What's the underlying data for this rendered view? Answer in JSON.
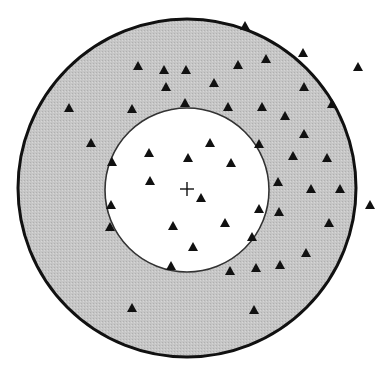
{
  "diagram": {
    "type": "concentric-circles-scatter",
    "colors": {
      "background": "#ffffff",
      "outer_ring_fill": "#c4c4c4",
      "inner_disc_fill": "#ffffff",
      "outer_stroke": "#111111",
      "inner_stroke": "#333333",
      "marker": "#111111"
    },
    "outer_circle": {
      "cx": 187,
      "cy": 188,
      "r": 169
    },
    "inner_circle": {
      "cx": 187,
      "cy": 190,
      "r": 82
    },
    "center_mark": {
      "x": 187,
      "y": 189,
      "size": 7,
      "glyph": "plus"
    },
    "marker_shape": "triangle",
    "markers": [
      [
        245,
        26
      ],
      [
        303,
        53
      ],
      [
        358,
        67
      ],
      [
        138,
        66
      ],
      [
        164,
        70
      ],
      [
        186,
        70
      ],
      [
        238,
        65
      ],
      [
        266,
        59
      ],
      [
        166,
        87
      ],
      [
        214,
        83
      ],
      [
        304,
        87
      ],
      [
        69,
        108
      ],
      [
        132,
        109
      ],
      [
        185,
        103
      ],
      [
        228,
        107
      ],
      [
        262,
        107
      ],
      [
        285,
        116
      ],
      [
        332,
        104
      ],
      [
        91,
        143
      ],
      [
        304,
        134
      ],
      [
        149,
        153
      ],
      [
        188,
        158
      ],
      [
        210,
        143
      ],
      [
        231,
        163
      ],
      [
        259,
        144
      ],
      [
        293,
        156
      ],
      [
        327,
        158
      ],
      [
        112,
        162
      ],
      [
        150,
        181
      ],
      [
        201,
        198
      ],
      [
        278,
        182
      ],
      [
        311,
        189
      ],
      [
        340,
        189
      ],
      [
        370,
        205
      ],
      [
        111,
        205
      ],
      [
        110,
        227
      ],
      [
        173,
        226
      ],
      [
        225,
        223
      ],
      [
        259,
        209
      ],
      [
        279,
        212
      ],
      [
        329,
        223
      ],
      [
        193,
        247
      ],
      [
        252,
        237
      ],
      [
        306,
        253
      ],
      [
        171,
        266
      ],
      [
        230,
        271
      ],
      [
        256,
        268
      ],
      [
        280,
        265
      ],
      [
        132,
        308
      ],
      [
        254,
        310
      ]
    ]
  }
}
